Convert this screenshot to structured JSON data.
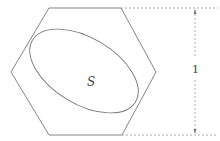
{
  "diagram": {
    "shapes": {
      "hexagon": {
        "kind": "regular-hexagon",
        "stroke": "#777777"
      },
      "ellipse": {
        "kind": "rotated-ellipse",
        "stroke": "#777777"
      }
    },
    "labels": {
      "region": "S",
      "height": "1"
    },
    "dimension": {
      "value": "1",
      "style": "dashed",
      "color": "#999999"
    }
  }
}
